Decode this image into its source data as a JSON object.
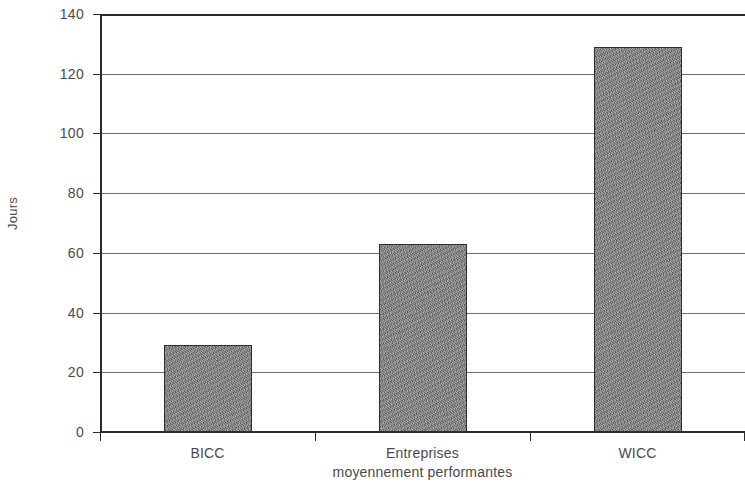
{
  "chart_data": {
    "type": "bar",
    "title": "",
    "subtitle": "",
    "xlabel": "",
    "ylabel": "Jours",
    "categories": [
      "BICC",
      "Entreprises moyennement performantes",
      "WICC"
    ],
    "category_lines": [
      [
        "BICC"
      ],
      [
        "Entreprises",
        "moyennement performantes"
      ],
      [
        "WICC"
      ]
    ],
    "values": [
      29,
      63,
      129
    ],
    "series": [
      {
        "name": "Jours",
        "values": [
          29,
          63,
          129
        ]
      }
    ],
    "ylim": [
      0,
      140
    ],
    "xlim": null,
    "y_ticks": [
      0,
      20,
      40,
      60,
      80,
      100,
      120,
      140
    ],
    "y_tick_labels": [
      "0",
      "20",
      "40",
      "60",
      "80",
      "100",
      "120",
      "140"
    ],
    "grid": true,
    "grid_axis": "y",
    "legend": false,
    "legend_position": "none",
    "bar_color": "#808080",
    "bar_edge_color": "#2e2e2e",
    "axis_color": "#2b2b2b",
    "grid_color": "#555555",
    "text_color": "#4a4a4a",
    "background_color": "#ffffff",
    "annotations": []
  }
}
